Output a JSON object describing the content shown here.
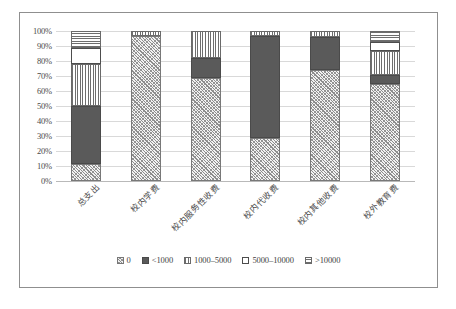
{
  "chart_data": {
    "type": "bar",
    "subtype": "stacked-100-percent",
    "title": "",
    "xlabel": "",
    "ylabel": "",
    "ylim": [
      0,
      100
    ],
    "ytick_labels": [
      "100%",
      "90%",
      "80%",
      "70%",
      "60%",
      "50%",
      "40%",
      "30%",
      "20%",
      "10%",
      "0%"
    ],
    "ytick_values": [
      100,
      90,
      80,
      70,
      60,
      50,
      40,
      30,
      20,
      10,
      0
    ],
    "grid": true,
    "legend_position": "bottom",
    "categories": [
      "总支出",
      "校内学费",
      "校内服务性收费",
      "校内代收费",
      "校内其他收费",
      "校外教育费"
    ],
    "series": [
      {
        "name": "0",
        "pattern": "diagonal-hatch",
        "values": [
          11.5,
          96.5,
          69.0,
          29.0,
          74.0,
          65.0
        ]
      },
      {
        "name": "<1000",
        "pattern": "solid-dark",
        "values": [
          38.5,
          0.0,
          13.0,
          68.0,
          22.0,
          6.0
        ]
      },
      {
        "name": "1000–5000",
        "pattern": "vertical-lines",
        "values": [
          28.0,
          3.5,
          18.0,
          3.0,
          4.0,
          16.0
        ]
      },
      {
        "name": "5000–10000",
        "pattern": "white-empty",
        "values": [
          10.5,
          0.0,
          0.0,
          0.0,
          0.0,
          6.0
        ]
      },
      {
        "name": ">10000",
        "pattern": "horizontal-lines",
        "values": [
          11.5,
          0.0,
          0.0,
          0.0,
          0.0,
          7.0
        ]
      }
    ]
  },
  "legend": {
    "items": [
      {
        "label": "0",
        "swatch": "diagonal-hatch-swatch"
      },
      {
        "label": "<1000",
        "swatch": "solid-dark-swatch"
      },
      {
        "label": "1000–5000",
        "swatch": "vertical-lines-swatch"
      },
      {
        "label": "5000–10000",
        "swatch": "white-empty-swatch"
      },
      {
        "label": ">10000",
        "swatch": "horizontal-lines-swatch"
      }
    ]
  },
  "colors": {
    "frame": "#8f8f8f",
    "gridline": "#d9d9d9",
    "axis_text": "#4a4a4a",
    "series_dark": "#5a5a5a",
    "series_hatch": "#8c8c8c",
    "background": "#ffffff"
  },
  "caption": ""
}
